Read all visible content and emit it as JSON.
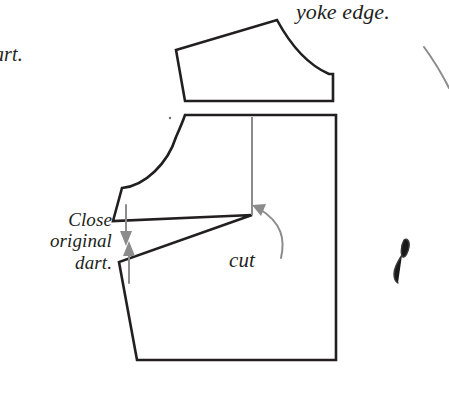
{
  "figure": {
    "kind": "sewing-pattern-diagram",
    "background_color": "#ffffff",
    "ink_color": "#231f20",
    "guide_color": "#8c8c8c",
    "line_width_outline": 2.6,
    "line_width_guide": 2.0
  },
  "labels": {
    "yoke_edge": "yoke edge.",
    "clipped_left": "art.",
    "close_original_dart": "Close\noriginal\ndart.",
    "cut": "cut"
  },
  "shapes": {
    "yoke_piece": {
      "name": "yoke-piece",
      "path": "M 176 50 L 277 20 C 290 44 306 64 329 74 L 333 74 L 333 101 L 185 101 L 176 50 Z"
    },
    "bodice_piece": {
      "name": "bodice-front-piece",
      "path": "M 185 115 L 336 115 L 336 360 L 137 360 L 119 262 L 252 215 L 113 221 L 122 188 C 145 186 168 163 176 137 C 180 128 183 121 185 115 Z"
    },
    "cut_line": {
      "name": "cut-slash-line",
      "path": "M 252 117 L 252 215"
    },
    "ink_speck": {
      "name": "ink-speck-artifact",
      "path": "M 404 240 C 407 238 410 241 409 247 C 408 253 405 258 403 257 C 401 256 400 247 404 240 Z M 402 255 C 398 261 394 268 394 274 C 394 279 396 282 398 283"
    },
    "notch_dot": {
      "name": "notch-dot-marker",
      "cx": 170,
      "cy": 118,
      "r": 1.2
    }
  },
  "arrows": {
    "yoke_leader": {
      "name": "yoke-edge-leader-line",
      "path": "M 424 47 C 432 58 442 74 449 88"
    },
    "cut_arrow": {
      "name": "cut-curved-arrow",
      "path": "M 281 258 C 285 240 283 223 258 208",
      "head": "M 252 205 L 266 204 L 261 216 Z"
    },
    "dart_close_down": {
      "name": "dart-close-down-arrow",
      "shaft": "M 126 205 L 126 237",
      "head": "M 126 246 L 120 231 L 132 231 Z"
    },
    "dart_close_up": {
      "name": "dart-close-up-arrow",
      "shaft": "M 129 283 L 129 250",
      "head": "M 129 241 L 135 256 L 123 256 Z"
    }
  }
}
